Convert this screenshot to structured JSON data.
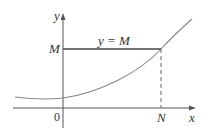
{
  "diagram": {
    "colors": {
      "axis": "#555555",
      "curve": "#888888",
      "line": "#444444",
      "dashed": "#666666",
      "text": "#333333"
    },
    "labels": {
      "y_axis": "y",
      "x_axis": "x",
      "origin": "0",
      "m_tick": "M",
      "n_tick": "N",
      "line_label": "y = M"
    }
  }
}
